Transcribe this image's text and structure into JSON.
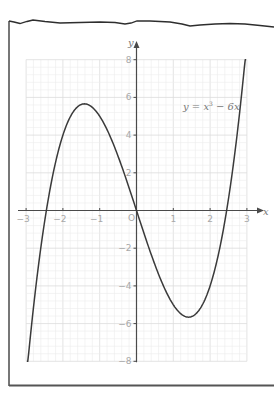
{
  "chart_data": {
    "type": "line",
    "title": "",
    "function": "y = x^3 - 6x",
    "series": [
      {
        "name": "y = x³ − 6x",
        "x": [
          -2.65,
          -2.5,
          -2,
          -1.5,
          -1.414,
          -1,
          -0.5,
          0,
          0.5,
          1,
          1.414,
          1.5,
          2,
          2.5,
          2.65
        ],
        "y": [
          -2.71,
          -0.625,
          4,
          5.625,
          5.657,
          5,
          2.875,
          0,
          -2.875,
          -5,
          -5.657,
          -5.625,
          -4,
          0.625,
          2.71
        ]
      }
    ],
    "plot_range": {
      "x": [
        -2.98,
        2.98
      ],
      "y": [
        -8,
        8
      ]
    },
    "xlabel": "x",
    "ylabel": "y",
    "xlim": [
      -3,
      3
    ],
    "ylim": [
      -8,
      8
    ],
    "x_ticks": [
      -3,
      -2,
      -1,
      1,
      2,
      3
    ],
    "x_tick_labels": [
      "−3",
      "−2",
      "−1",
      "1",
      "2",
      "3"
    ],
    "y_ticks": [
      -8,
      -6,
      -4,
      -2,
      2,
      4,
      6,
      8
    ],
    "y_tick_labels": [
      "−8",
      "−6",
      "−4",
      "−2",
      "2",
      "4",
      "6",
      "8"
    ],
    "origin_label": "O",
    "annotations": [
      {
        "text": "y = x³ − 6x",
        "x": 2.0,
        "y": 5.4
      }
    ],
    "key_points": {
      "local_max": [
        -1.414,
        5.657
      ],
      "local_min": [
        1.414,
        -5.657
      ],
      "roots": [
        -2.449,
        0,
        2.449
      ]
    },
    "grid": true,
    "legend": "none"
  },
  "labels": {
    "x_axis": "x",
    "y_axis": "y",
    "origin": "O",
    "equation_y": "y",
    "equation_eq": " = ",
    "equation_x": "x",
    "equation_exp": "3",
    "equation_rest": " − 6x"
  },
  "colors": {
    "curve": "#3a3a3a",
    "axes": "#4a4a4a",
    "grid_minor": "#ececec",
    "grid_major": "#dcdcdc",
    "frame": "#2e2e2e",
    "tick_text": "#a8a8a8"
  }
}
